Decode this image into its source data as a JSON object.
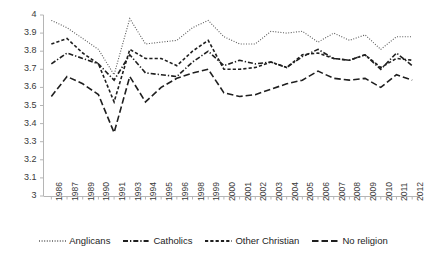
{
  "chart_data": {
    "type": "line",
    "title": "",
    "subtitle": "",
    "xlabel": "",
    "ylabel": "",
    "ylim": [
      3,
      4
    ],
    "ytick_step": 0.1,
    "yticks": [
      "4",
      "3.9",
      "3.8",
      "3.7",
      "3.6",
      "3.5",
      "3.4",
      "3.3",
      "3.2",
      "3.1",
      "3"
    ],
    "grid": false,
    "legend_position": "bottom",
    "categories": [
      "1986",
      "1987",
      "1989",
      "1990",
      "1991",
      "1993",
      "1994",
      "1995",
      "1996",
      "1998",
      "1999",
      "2000",
      "2001",
      "2002",
      "2003",
      "2004",
      "2005",
      "2006",
      "2007",
      "2008",
      "2009",
      "2010",
      "2011",
      "2012"
    ],
    "series": [
      {
        "name": "Anglicans",
        "style": "dotted",
        "color": "#5a5a5a",
        "values": [
          3.97,
          3.93,
          3.87,
          3.81,
          3.67,
          3.98,
          3.84,
          3.85,
          3.86,
          3.93,
          3.97,
          3.88,
          3.84,
          3.84,
          3.91,
          3.9,
          3.91,
          3.85,
          3.9,
          3.86,
          3.89,
          3.81,
          3.88,
          3.88
        ]
      },
      {
        "name": "Catholics",
        "style": "dash-dot",
        "color": "#1f1f1f",
        "values": [
          3.73,
          3.79,
          3.76,
          3.73,
          3.64,
          3.78,
          3.68,
          3.67,
          3.66,
          3.74,
          3.8,
          3.72,
          3.75,
          3.73,
          3.74,
          3.71,
          3.77,
          3.81,
          3.76,
          3.75,
          3.78,
          3.7,
          3.79,
          3.72
        ]
      },
      {
        "name": "Other Christian",
        "style": "dashed-short",
        "color": "#1f1f1f",
        "values": [
          3.84,
          3.87,
          3.79,
          3.73,
          3.52,
          3.81,
          3.76,
          3.76,
          3.72,
          3.8,
          3.86,
          3.7,
          3.7,
          3.71,
          3.74,
          3.71,
          3.78,
          3.79,
          3.76,
          3.75,
          3.78,
          3.71,
          3.76,
          3.75
        ]
      },
      {
        "name": "No religion",
        "style": "dashed-long",
        "color": "#1f1f1f",
        "values": [
          3.55,
          3.66,
          3.62,
          3.56,
          3.35,
          3.66,
          3.52,
          3.6,
          3.65,
          3.68,
          3.7,
          3.57,
          3.55,
          3.56,
          3.59,
          3.62,
          3.64,
          3.69,
          3.65,
          3.64,
          3.65,
          3.6,
          3.67,
          3.64
        ]
      }
    ]
  },
  "legend": {
    "items": [
      {
        "label": "Anglicans"
      },
      {
        "label": "Catholics"
      },
      {
        "label": "Other Christian"
      },
      {
        "label": "No religion"
      }
    ]
  }
}
